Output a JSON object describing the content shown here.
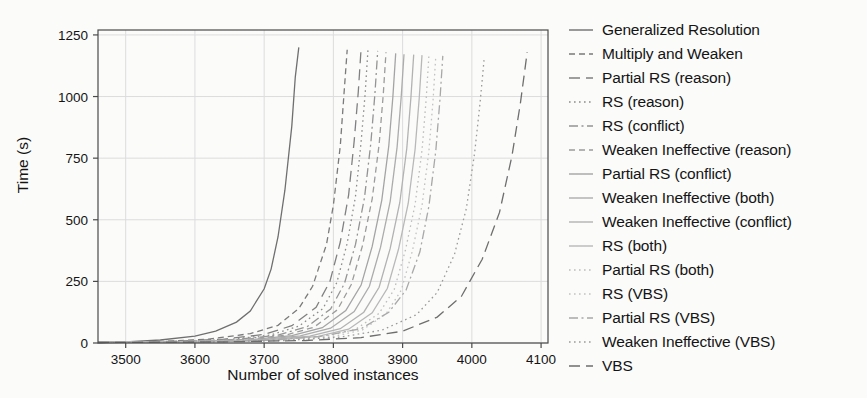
{
  "chart_data": {
    "type": "line",
    "title": "",
    "xlabel": "Number of solved instances",
    "ylabel": "Time (s)",
    "xlim": [
      3460,
      4110
    ],
    "ylim": [
      0,
      1270
    ],
    "xticks": [
      3500,
      3600,
      3700,
      3800,
      3900,
      4000,
      4100
    ],
    "yticks": [
      0,
      250,
      500,
      750,
      1000,
      1250
    ],
    "grid": true,
    "legend_position": "right",
    "series": [
      {
        "name": "Generalized Resolution",
        "dash": "solid",
        "color": "#6f6f6f",
        "x": [
          3460,
          3500,
          3550,
          3600,
          3630,
          3660,
          3680,
          3700,
          3710,
          3720,
          3730,
          3740,
          3745,
          3750
        ],
        "y": [
          2,
          5,
          12,
          28,
          48,
          85,
          130,
          220,
          300,
          430,
          620,
          880,
          1080,
          1200
        ]
      },
      {
        "name": "Multiply and Weaken",
        "dash": "dashed",
        "color": "#7a7a7a",
        "x": [
          3460,
          3550,
          3620,
          3680,
          3720,
          3750,
          3770,
          3790,
          3800,
          3810,
          3815,
          3820
        ],
        "y": [
          2,
          6,
          16,
          38,
          72,
          140,
          230,
          400,
          560,
          800,
          1000,
          1190
        ]
      },
      {
        "name": "Partial RS (reason)",
        "dash": "dashed-long",
        "color": "#808080",
        "x": [
          3460,
          3560,
          3640,
          3700,
          3740,
          3775,
          3795,
          3810,
          3822,
          3830,
          3836,
          3840
        ],
        "y": [
          2,
          6,
          15,
          35,
          70,
          145,
          250,
          410,
          600,
          820,
          1020,
          1195
        ]
      },
      {
        "name": "RS (reason)",
        "dash": "dotted",
        "color": "#8c8c8c",
        "x": [
          3460,
          3570,
          3650,
          3710,
          3750,
          3785,
          3805,
          3820,
          3832,
          3840,
          3846,
          3850
        ],
        "y": [
          2,
          6,
          14,
          33,
          68,
          140,
          245,
          405,
          595,
          815,
          1015,
          1190
        ]
      },
      {
        "name": "RS (conflict)",
        "dash": "dash-dot",
        "color": "#949494",
        "x": [
          3460,
          3580,
          3660,
          3720,
          3762,
          3796,
          3816,
          3832,
          3845,
          3854,
          3860,
          3864
        ],
        "y": [
          2,
          6,
          14,
          32,
          66,
          138,
          242,
          400,
          590,
          810,
          1010,
          1185
        ]
      },
      {
        "name": "Weaken Ineffective (reason)",
        "dash": "dashed",
        "color": "#9c9c9c",
        "x": [
          3460,
          3590,
          3670,
          3730,
          3772,
          3806,
          3826,
          3842,
          3856,
          3866,
          3872,
          3876
        ],
        "y": [
          2,
          6,
          14,
          31,
          64,
          135,
          238,
          395,
          585,
          805,
          1005,
          1180
        ]
      },
      {
        "name": "Partial RS (conflict)",
        "dash": "solid",
        "color": "#a4a4a4",
        "x": [
          3460,
          3600,
          3680,
          3740,
          3784,
          3818,
          3840,
          3856,
          3870,
          3880,
          3886,
          3890
        ],
        "y": [
          2,
          6,
          13,
          30,
          62,
          132,
          235,
          392,
          580,
          800,
          1000,
          1175
        ]
      },
      {
        "name": "Weaken Ineffective (both)",
        "dash": "solid",
        "color": "#acacac",
        "x": [
          3460,
          3610,
          3692,
          3752,
          3796,
          3830,
          3852,
          3868,
          3882,
          3892,
          3898,
          3902
        ],
        "y": [
          2,
          6,
          13,
          29,
          60,
          128,
          230,
          388,
          575,
          795,
          998,
          1172
        ]
      },
      {
        "name": "Weaken Ineffective (conflict)",
        "dash": "solid",
        "color": "#b2b2b2",
        "x": [
          3460,
          3620,
          3704,
          3766,
          3810,
          3844,
          3866,
          3882,
          3896,
          3906,
          3912,
          3916
        ],
        "y": [
          2,
          6,
          12,
          28,
          58,
          125,
          226,
          384,
          570,
          790,
          995,
          1170
        ]
      },
      {
        "name": "RS (both)",
        "dash": "solid",
        "color": "#b8b8b8",
        "x": [
          3460,
          3630,
          3716,
          3778,
          3822,
          3856,
          3878,
          3894,
          3908,
          3918,
          3924,
          3928
        ],
        "y": [
          2,
          6,
          12,
          27,
          56,
          122,
          222,
          380,
          566,
          786,
          992,
          1168
        ]
      },
      {
        "name": "Partial RS (both)",
        "dash": "dotted",
        "color": "#bdbdbd",
        "x": [
          3460,
          3640,
          3726,
          3788,
          3832,
          3866,
          3888,
          3904,
          3918,
          3928,
          3934,
          3938
        ],
        "y": [
          2,
          6,
          12,
          26,
          55,
          120,
          218,
          376,
          562,
          782,
          990,
          1166
        ]
      },
      {
        "name": "RS (VBS)",
        "dash": "dotted",
        "color": "#c2c2c2",
        "x": [
          3460,
          3650,
          3736,
          3798,
          3842,
          3876,
          3898,
          3914,
          3928,
          3938,
          3944,
          3948
        ],
        "y": [
          2,
          6,
          11,
          25,
          53,
          118,
          214,
          372,
          558,
          778,
          988,
          1164
        ]
      },
      {
        "name": "Partial RS (VBS)",
        "dash": "dash-dot",
        "color": "#a8a8a8",
        "x": [
          3460,
          3600,
          3700,
          3780,
          3840,
          3880,
          3905,
          3925,
          3938,
          3948,
          3954,
          3958
        ],
        "y": [
          2,
          5,
          11,
          26,
          58,
          125,
          215,
          370,
          555,
          780,
          990,
          1165
        ]
      },
      {
        "name": "Weaken Ineffective (VBS)",
        "dash": "dotted",
        "color": "#9a9a9a",
        "x": [
          3460,
          3620,
          3730,
          3810,
          3870,
          3920,
          3950,
          3975,
          3992,
          4004,
          4012,
          4018
        ],
        "y": [
          2,
          5,
          10,
          24,
          52,
          115,
          205,
          360,
          545,
          770,
          980,
          1160
        ]
      },
      {
        "name": "VBS",
        "dash": "dashed-long",
        "color": "#6e6e6e",
        "x": [
          3460,
          3650,
          3760,
          3840,
          3900,
          3950,
          3985,
          4015,
          4040,
          4058,
          4070,
          4080
        ],
        "y": [
          2,
          5,
          10,
          22,
          48,
          105,
          190,
          340,
          530,
          760,
          970,
          1180
        ]
      }
    ]
  },
  "legend": {
    "items": [
      {
        "label": "Generalized Resolution"
      },
      {
        "label": "Multiply and Weaken"
      },
      {
        "label": "Partial RS (reason)"
      },
      {
        "label": "RS (reason)"
      },
      {
        "label": "RS (conflict)"
      },
      {
        "label": "Weaken Ineffective (reason)"
      },
      {
        "label": "Partial RS (conflict)"
      },
      {
        "label": "Weaken Ineffective (both)"
      },
      {
        "label": "Weaken Ineffective (conflict)"
      },
      {
        "label": "RS (both)"
      },
      {
        "label": "Partial RS (both)"
      },
      {
        "label": "RS (VBS)"
      },
      {
        "label": "Partial RS (VBS)"
      },
      {
        "label": "Weaken Ineffective (VBS)"
      },
      {
        "label": "VBS"
      }
    ]
  },
  "style": {
    "background": "#fbfbfa",
    "grid_color": "#dcdcdc",
    "axis_color": "#4a4a4a",
    "text_color": "#141414"
  }
}
